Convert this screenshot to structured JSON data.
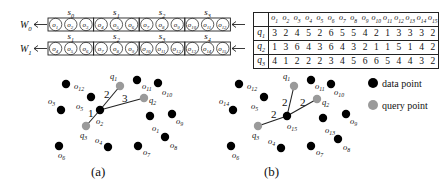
{
  "windows": [
    {
      "label": "W",
      "sub": "0",
      "segments": [
        {
          "label": "s",
          "sub": "0",
          "objects": [
            "1",
            "2",
            "3"
          ]
        },
        {
          "label": "s",
          "sub": "1",
          "objects": [
            "4",
            "5",
            "6"
          ]
        },
        {
          "label": "s",
          "sub": "2",
          "objects": [
            "7",
            "8",
            "9"
          ]
        },
        {
          "label": "s",
          "sub": "3",
          "objects": [
            "10",
            "11",
            "12"
          ]
        }
      ]
    },
    {
      "label": "W",
      "sub": "1",
      "segments": [
        {
          "label": "s",
          "sub": "1",
          "objects": [
            "4",
            "5",
            "6"
          ]
        },
        {
          "label": "s",
          "sub": "2",
          "objects": [
            "7",
            "8",
            "9"
          ]
        },
        {
          "label": "s",
          "sub": "3",
          "objects": [
            "10",
            "11",
            "12"
          ]
        },
        {
          "label": "s",
          "sub": "4",
          "objects": [
            "13",
            "14",
            "15"
          ]
        }
      ]
    }
  ],
  "distance_table": {
    "columns": [
      "o1",
      "o2",
      "o3",
      "o4",
      "o5",
      "o6",
      "o7",
      "o8",
      "o9",
      "o10",
      "o11",
      "o12",
      "o13",
      "o14",
      "o15"
    ],
    "rows": [
      {
        "query": "q1",
        "values": [
          "3",
          "2",
          "4",
          "5",
          "2",
          "6",
          "5",
          "5",
          "4",
          "2",
          "1",
          "3",
          "3",
          "3",
          "2"
        ]
      },
      {
        "query": "q2",
        "values": [
          "1",
          "3",
          "6",
          "4",
          "3",
          "6",
          "4",
          "3",
          "2",
          "1",
          "1",
          "5",
          "1",
          "4",
          "2"
        ]
      },
      {
        "query": "q3",
        "values": [
          "4",
          "1",
          "2",
          "2",
          "2",
          "3",
          "4",
          "5",
          "6",
          "6",
          "5",
          "4",
          "4",
          "3",
          "2"
        ]
      }
    ]
  },
  "diagrams": [
    {
      "caption": "(a)",
      "data_points": [
        {
          "id": "o12",
          "x": 66,
          "y": 84,
          "lx": 74,
          "ly": 89
        },
        {
          "id": "o3",
          "x": 61,
          "y": 110,
          "lx": 48,
          "ly": 104
        },
        {
          "id": "o5",
          "x": 91,
          "y": 97,
          "lx": 76,
          "ly": 109
        },
        {
          "id": "o2",
          "x": 100,
          "y": 110,
          "lx": 96,
          "ly": 124
        },
        {
          "id": "o11",
          "x": 137,
          "y": 80,
          "lx": 142,
          "ly": 89
        },
        {
          "id": "o10",
          "x": 158,
          "y": 83,
          "lx": 162,
          "ly": 95
        },
        {
          "id": "o1",
          "x": 150,
          "y": 116,
          "lx": 152,
          "ly": 131
        },
        {
          "id": "o9",
          "x": 172,
          "y": 114,
          "lx": 176,
          "ly": 124
        },
        {
          "id": "o6",
          "x": 59,
          "y": 146,
          "lx": 58,
          "ly": 158
        },
        {
          "id": "o4",
          "x": 108,
          "y": 147,
          "lx": 95,
          "ly": 143
        },
        {
          "id": "o7",
          "x": 138,
          "y": 146,
          "lx": 143,
          "ly": 155
        },
        {
          "id": "o8",
          "x": 165,
          "y": 137,
          "lx": 170,
          "ly": 148
        }
      ],
      "query_points": [
        {
          "id": "q1",
          "x": 120,
          "y": 86,
          "lx": 110,
          "ly": 79
        },
        {
          "id": "q2",
          "x": 144,
          "y": 98,
          "lx": 149,
          "ly": 103
        },
        {
          "id": "q3",
          "x": 86,
          "y": 126,
          "lx": 80,
          "ly": 138
        }
      ],
      "edges": [
        {
          "from": "o2",
          "to": "q1",
          "weight": "2",
          "lx": 104,
          "ly": 98
        },
        {
          "from": "o2",
          "to": "q2",
          "weight": "3",
          "lx": 122,
          "ly": 102
        },
        {
          "from": "o2",
          "to": "q3",
          "weight": "1",
          "lx": 88,
          "ly": 117
        }
      ]
    },
    {
      "caption": "(b)",
      "data_points": [
        {
          "id": "o12",
          "x": 239,
          "y": 84,
          "lx": 247,
          "ly": 89
        },
        {
          "id": "o14",
          "x": 233,
          "y": 110,
          "lx": 219,
          "ly": 104
        },
        {
          "id": "o5",
          "x": 264,
          "y": 97,
          "lx": 251,
          "ly": 109
        },
        {
          "id": "o15",
          "x": 287,
          "y": 116,
          "lx": 287,
          "ly": 129
        },
        {
          "id": "o11",
          "x": 311,
          "y": 80,
          "lx": 315,
          "ly": 89
        },
        {
          "id": "o10",
          "x": 331,
          "y": 84,
          "lx": 334,
          "ly": 95
        },
        {
          "id": "o13",
          "x": 323,
          "y": 118,
          "lx": 325,
          "ly": 133
        },
        {
          "id": "o9",
          "x": 346,
          "y": 114,
          "lx": 350,
          "ly": 124
        },
        {
          "id": "o6",
          "x": 231,
          "y": 146,
          "lx": 232,
          "ly": 158
        },
        {
          "id": "o4",
          "x": 281,
          "y": 148,
          "lx": 268,
          "ly": 144
        },
        {
          "id": "o7",
          "x": 311,
          "y": 146,
          "lx": 316,
          "ly": 155
        },
        {
          "id": "o8",
          "x": 338,
          "y": 139,
          "lx": 343,
          "ly": 150
        }
      ],
      "query_points": [
        {
          "id": "q1",
          "x": 294,
          "y": 86,
          "lx": 283,
          "ly": 79
        },
        {
          "id": "q2",
          "x": 317,
          "y": 99,
          "lx": 322,
          "ly": 105
        },
        {
          "id": "q3",
          "x": 258,
          "y": 126,
          "lx": 252,
          "ly": 138
        }
      ],
      "edges": [
        {
          "from": "o15",
          "to": "q1",
          "weight": "2",
          "lx": 282,
          "ly": 106
        },
        {
          "from": "o15",
          "to": "q2",
          "weight": "2",
          "lx": 300,
          "ly": 106
        },
        {
          "from": "o15",
          "to": "q3",
          "weight": "2",
          "lx": 271,
          "ly": 118
        }
      ]
    }
  ],
  "legend": [
    {
      "label": "data point",
      "color": "#000000"
    },
    {
      "label": "query point",
      "color": "#9a9a9a"
    }
  ],
  "colors": {
    "data_point": "#000000",
    "query_point": "#9a9a9a",
    "line": "#222222"
  }
}
